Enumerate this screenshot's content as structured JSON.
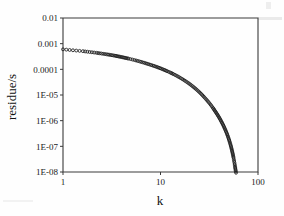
{
  "figure": {
    "background_color": "#fefefe",
    "ink_color": "#1c1c1c",
    "axis_color": "#3a3a3a"
  },
  "chart_data": {
    "type": "scatter",
    "title": "",
    "subtitle": "",
    "xlabel": "k",
    "ylabel": "residue/s",
    "xscale": "log",
    "yscale": "log",
    "xlim": [
      1,
      100
    ],
    "ylim": [
      1e-08,
      0.01
    ],
    "grid": false,
    "legend": null,
    "marker": "open-circle",
    "xticks": [
      1,
      10,
      100
    ],
    "xticklabels": [
      "1",
      "10",
      "100"
    ],
    "yticks": [
      0.01,
      0.001,
      0.0001,
      1e-05,
      1e-06,
      1e-07,
      1e-08
    ],
    "yticklabels": [
      "0.01",
      "0.001",
      "0.0001",
      "1E-05",
      "1E-06",
      "1E-07",
      "1E-08"
    ],
    "series": [
      {
        "name": "residue",
        "x": [
          1,
          1.6,
          2.2,
          2.8,
          3.4,
          4,
          4.7,
          5.4,
          6.1,
          6.8,
          7.5,
          8.3,
          9.1,
          9.9,
          10.8,
          11.7,
          12.6,
          13.6,
          14.6,
          15.6,
          16.7,
          17.8,
          19,
          20.2,
          21.4,
          22.7,
          24,
          25.4,
          26.8,
          28.2,
          29.7,
          31.2,
          32.8,
          34.4,
          36,
          37.7,
          39.4,
          41.1,
          42.8,
          44.5,
          46.1,
          47.7,
          49.2,
          50.6,
          51.9,
          53.1,
          54.2,
          55.2,
          56.1,
          56.9,
          57.6,
          58.2,
          58.7,
          59.1,
          59.5,
          59.8,
          60.1,
          60.3,
          60.5,
          60.7
        ],
        "y": [
          0.0006,
          0.00051,
          0.00044,
          0.000385,
          0.00034,
          0.0003,
          0.000262,
          0.00023,
          0.000203,
          0.00018,
          0.00016,
          0.000141,
          0.000125,
          0.000111,
          9.7e-05,
          8.5e-05,
          7.5e-05,
          6.5e-05,
          5.65e-05,
          4.9e-05,
          4.2e-05,
          3.6e-05,
          3.05e-05,
          2.58e-05,
          2.17e-05,
          1.81e-05,
          1.5e-05,
          1.23e-05,
          1e-05,
          8.1e-06,
          6.5e-06,
          5.2e-06,
          4.1e-06,
          3.2e-06,
          2.47e-06,
          1.9e-06,
          1.45e-06,
          1.1e-06,
          8.2e-07,
          6.1e-07,
          4.5e-07,
          3.3e-07,
          2.4e-07,
          1.75e-07,
          1.27e-07,
          9.2e-08,
          6.7e-08,
          4.9e-08,
          3.6e-08,
          2.7e-08,
          2.05e-08,
          1.6e-08,
          1.3e-08,
          1.1e-08,
          9.5e-09,
          8.6e-09,
          8e-09,
          7.6e-09,
          7.3e-09,
          7.1e-09
        ]
      }
    ]
  }
}
